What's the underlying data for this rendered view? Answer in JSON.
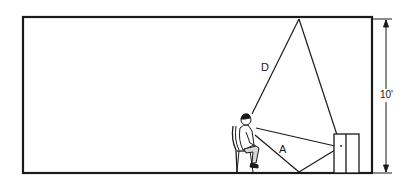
{
  "diagram": {
    "type": "room cross-section",
    "colors": {
      "stroke": "#1a1a1a",
      "background": "#ffffff"
    },
    "labels": {
      "direct_path": "D",
      "alternate_path": "A",
      "height_dimension": "10'"
    },
    "elements": {
      "room": "room outline (walls, ceiling, floor)",
      "person": "seated child on chair",
      "speaker": "cabinet / loudspeaker box",
      "dimension": "ceiling height dimension line with arrows"
    }
  }
}
